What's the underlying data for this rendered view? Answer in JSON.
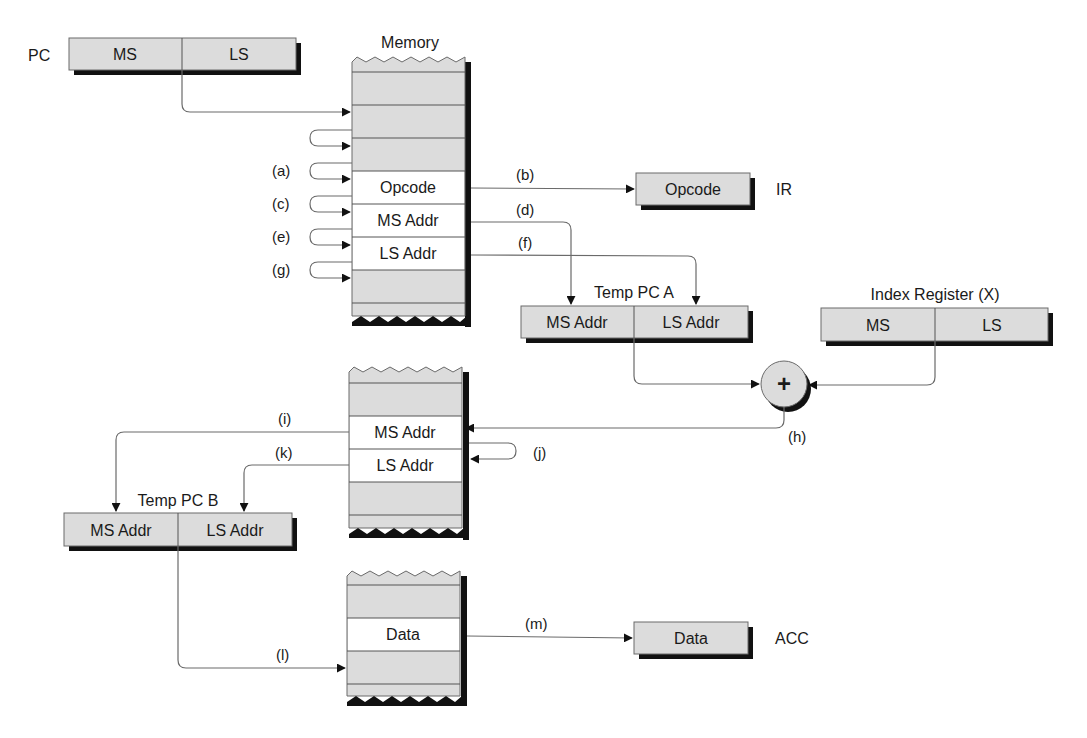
{
  "colors": {
    "register_fill": "#dcdcdc",
    "memory_fill": "#dcdcdc",
    "highlight_fill": "#ffffff",
    "shadow": "#111111",
    "line": "#6a6a6a",
    "text": "#1a1a1a"
  },
  "registers": {
    "pc": {
      "label": "PC",
      "left": "MS",
      "right": "LS"
    },
    "ir": {
      "label": "IR",
      "value": "Opcode"
    },
    "temp_pc_a": {
      "label": "Temp PC A",
      "left": "MS Addr",
      "right": "LS Addr"
    },
    "index_register": {
      "label": "Index Register (X)",
      "left": "MS",
      "right": "LS"
    },
    "temp_pc_b": {
      "label": "Temp PC B",
      "left": "MS Addr",
      "right": "LS Addr"
    },
    "acc": {
      "label": "ACC",
      "value": "Data"
    }
  },
  "memory": {
    "title": "Memory",
    "block1": {
      "rows": [
        "",
        "",
        "",
        "Opcode",
        "MS Addr",
        "LS Addr",
        ""
      ]
    },
    "block2": {
      "rows": [
        "",
        "MS Addr",
        "LS Addr",
        ""
      ]
    },
    "block3": {
      "rows": [
        "",
        "Data",
        ""
      ]
    }
  },
  "adder": {
    "symbol": "+"
  },
  "steps": {
    "a": "(a)",
    "b": "(b)",
    "c": "(c)",
    "d": "(d)",
    "e": "(e)",
    "f": "(f)",
    "g": "(g)",
    "h": "(h)",
    "i": "(i)",
    "j": "(j)",
    "k": "(k)",
    "l": "(l)",
    "m": "(m)"
  }
}
